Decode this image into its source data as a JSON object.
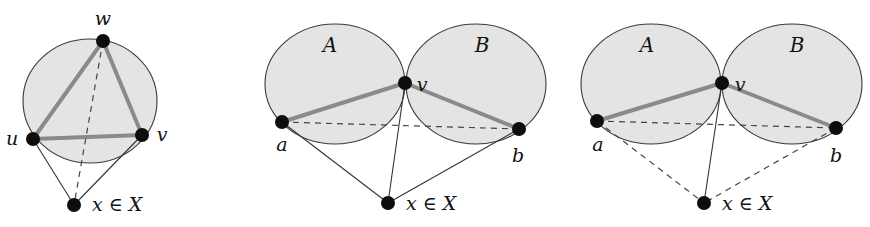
{
  "figure": {
    "panels": [
      {
        "id": "panel-1",
        "regions": [
          {
            "shape": "ellipse",
            "cx": 90,
            "cy": 101,
            "rx": 67,
            "ry": 62
          }
        ],
        "nodes": [
          {
            "id": "w",
            "label": "w",
            "x": 103,
            "y": 41,
            "label_x": 103,
            "label_y": 25
          },
          {
            "id": "u",
            "label": "u",
            "x": 33,
            "y": 139,
            "label_x": 12,
            "label_y": 145
          },
          {
            "id": "v",
            "label": "v",
            "x": 142,
            "y": 135,
            "label_x": 162,
            "label_y": 141
          },
          {
            "id": "x",
            "label": "x ∈ X",
            "x": 74,
            "y": 205,
            "label_x": 92,
            "label_y": 211
          }
        ],
        "thick_edges": [
          [
            "w",
            "u"
          ],
          [
            "w",
            "v"
          ],
          [
            "u",
            "v"
          ]
        ],
        "thin_edges": [
          [
            "u",
            "x"
          ],
          [
            "v",
            "x"
          ]
        ],
        "dashed_edges": [
          [
            "w",
            "x"
          ]
        ]
      },
      {
        "id": "panel-2",
        "regions": [
          {
            "shape": "ellipse",
            "cx": 335,
            "cy": 84,
            "rx": 70,
            "ry": 60,
            "label": "A",
            "label_x": 330,
            "label_y": 52
          },
          {
            "shape": "ellipse",
            "cx": 476,
            "cy": 84,
            "rx": 70,
            "ry": 60,
            "label": "B",
            "label_x": 482,
            "label_y": 52
          }
        ],
        "nodes": [
          {
            "id": "v",
            "label": "v",
            "x": 405,
            "y": 83,
            "label_x": 422,
            "label_y": 91
          },
          {
            "id": "a",
            "label": "a",
            "x": 282,
            "y": 122,
            "label_x": 282,
            "label_y": 151
          },
          {
            "id": "b",
            "label": "b",
            "x": 519,
            "y": 129,
            "label_x": 518,
            "label_y": 162
          },
          {
            "id": "x",
            "label": "x ∈ X",
            "x": 388,
            "y": 203,
            "label_x": 406,
            "label_y": 210
          }
        ],
        "thick_edges": [
          [
            "a",
            "v"
          ],
          [
            "v",
            "b"
          ]
        ],
        "thin_edges": [
          [
            "a",
            "x"
          ],
          [
            "v",
            "x"
          ],
          [
            "b",
            "x"
          ]
        ],
        "dashed_edges": [
          [
            "a",
            "b"
          ]
        ]
      },
      {
        "id": "panel-3",
        "regions": [
          {
            "shape": "ellipse",
            "cx": 651,
            "cy": 84,
            "rx": 70,
            "ry": 60,
            "label": "A",
            "label_x": 647,
            "label_y": 52
          },
          {
            "shape": "ellipse",
            "cx": 792,
            "cy": 84,
            "rx": 70,
            "ry": 60,
            "label": "B",
            "label_x": 797,
            "label_y": 52
          }
        ],
        "nodes": [
          {
            "id": "v",
            "label": "v",
            "x": 722,
            "y": 83,
            "label_x": 740,
            "label_y": 91
          },
          {
            "id": "a",
            "label": "a",
            "x": 597,
            "y": 121,
            "label_x": 598,
            "label_y": 151
          },
          {
            "id": "b",
            "label": "b",
            "x": 836,
            "y": 128,
            "label_x": 836,
            "label_y": 162
          },
          {
            "id": "x",
            "label": "x ∈ X",
            "x": 704,
            "y": 203,
            "label_x": 722,
            "label_y": 210
          }
        ],
        "thick_edges": [
          [
            "a",
            "v"
          ],
          [
            "v",
            "b"
          ]
        ],
        "thin_edges": [
          [
            "v",
            "x"
          ]
        ],
        "dashed_edges": [
          [
            "a",
            "b"
          ],
          [
            "a",
            "x"
          ],
          [
            "b",
            "x"
          ]
        ]
      }
    ],
    "colors": {
      "region_fill": "#e4e4e4",
      "region_stroke": "#3a3a3a",
      "thick_edge": "#8a8a8a",
      "node": "#0d0d0d",
      "background": "#ffffff"
    }
  }
}
